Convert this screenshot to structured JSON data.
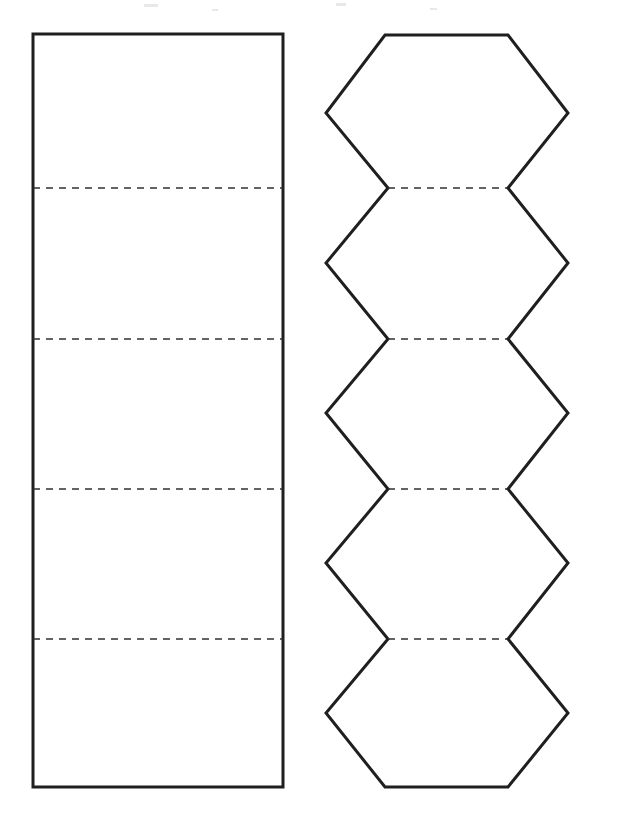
{
  "page": {
    "width": 622,
    "height": 829,
    "background_color": "#ffffff"
  },
  "style": {
    "cut_line_color": "#1f1f1f",
    "cut_line_width": 3.0,
    "fold_line_color": "#303030",
    "fold_line_width": 1.6,
    "fold_dash_pattern": "7 6",
    "fill_color": "#ffffff"
  },
  "figures": [
    {
      "id": "rectangular-strip",
      "name": "Rectangular Strip Net",
      "shape": "rectangle",
      "panel_count": 5,
      "outline": {
        "x": 33,
        "y": 34,
        "width": 250,
        "height": 753
      },
      "outline_points": "33,34 283,34 283,787 33,787",
      "fold_lines": [
        {
          "label": "fold-1",
          "y": 188,
          "x1": 33,
          "x2": 283
        },
        {
          "label": "fold-2",
          "y": 339,
          "x1": 33,
          "x2": 283
        },
        {
          "label": "fold-3",
          "y": 489,
          "x1": 33,
          "x2": 283
        },
        {
          "label": "fold-4",
          "y": 639,
          "x1": 33,
          "x2": 283
        }
      ],
      "panels": [
        {
          "label": "panel-1",
          "top": 34,
          "bottom": 188
        },
        {
          "label": "panel-2",
          "top": 188,
          "bottom": 339
        },
        {
          "label": "panel-3",
          "top": 339,
          "bottom": 489
        },
        {
          "label": "panel-4",
          "top": 489,
          "bottom": 639
        },
        {
          "label": "panel-5",
          "top": 639,
          "bottom": 787
        }
      ]
    },
    {
      "id": "hexagon-strip",
      "name": "Hexagon Strip Net",
      "shape": "hexagon-chain",
      "panel_count": 5,
      "geometry": {
        "narrow_left_x": 388,
        "narrow_right_x": 507,
        "wide_left_x": 326,
        "wide_right_x": 568,
        "top_edge_y": 35,
        "bottom_edge_y": 787,
        "wide_vertex_ys": [
          113,
          263,
          413,
          563,
          713
        ],
        "waist_ys": [
          188,
          339,
          489,
          639
        ]
      },
      "outline_points": "385,35 508,35 568,113 508,188 568,263 508,339 568,413 508,489 568,563 508,639 568,713 508,787 385,787 326,713 388,639 326,563 388,489 326,413 388,339 326,263 388,188 326,113",
      "fold_lines": [
        {
          "label": "fold-1",
          "y": 188,
          "x1": 388,
          "x2": 507
        },
        {
          "label": "fold-2",
          "y": 339,
          "x1": 388,
          "x2": 507
        },
        {
          "label": "fold-3",
          "y": 489,
          "x1": 388,
          "x2": 507
        },
        {
          "label": "fold-4",
          "y": 639,
          "x1": 388,
          "x2": 507
        }
      ],
      "panels": [
        {
          "label": "hexagon-1",
          "top": 35,
          "bottom": 188
        },
        {
          "label": "hexagon-2",
          "top": 188,
          "bottom": 339
        },
        {
          "label": "hexagon-3",
          "top": 339,
          "bottom": 489
        },
        {
          "label": "hexagon-4",
          "top": 489,
          "bottom": 639
        },
        {
          "label": "hexagon-5",
          "top": 639,
          "bottom": 787
        }
      ]
    }
  ],
  "artifacts": [
    {
      "x": 144,
      "y": 4,
      "width": 14,
      "height": 3
    },
    {
      "x": 336,
      "y": 3,
      "width": 10,
      "height": 3
    },
    {
      "x": 212,
      "y": 9,
      "width": 6,
      "height": 2
    },
    {
      "x": 430,
      "y": 8,
      "width": 7,
      "height": 2
    }
  ]
}
